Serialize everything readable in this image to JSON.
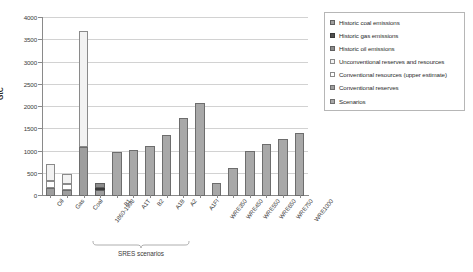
{
  "chart_data": {
    "type": "bar",
    "title": "",
    "subtitle": "",
    "xlabel": "",
    "ylabel": "GtC",
    "ylim": [
      0,
      4000
    ],
    "ytick_step": 500,
    "yticks": [
      "0",
      "500",
      "1000",
      "1500",
      "2000",
      "2500",
      "3000",
      "3500",
      "4000"
    ],
    "grid": "horizontal",
    "legend_position": "right",
    "categories": [
      "Oil",
      "Gas",
      "Coal",
      "1860-1998",
      "B1",
      "A1T",
      "B2",
      "A1B",
      "A2",
      "A1FI",
      "WRE350",
      "WRE450",
      "WRE550",
      "WRE650",
      "WRE750",
      "WRE1000"
    ],
    "series": [
      {
        "name": "Conventional reserves",
        "key": "conventional_reserves",
        "color": "#9e9e9e",
        "values": [
          170,
          140,
          1100,
          0,
          0,
          0,
          0,
          0,
          0,
          0,
          0,
          0,
          0,
          0,
          0,
          0
        ]
      },
      {
        "name": "Conventional resources (upper estimate)",
        "key": "conventional_resources_upper",
        "color": "#ffffff",
        "values": [
          160,
          125,
          0,
          0,
          0,
          0,
          0,
          0,
          0,
          0,
          0,
          0,
          0,
          0,
          0,
          0
        ]
      },
      {
        "name": "Unconventional reserves and resources",
        "key": "unconventional_reserves_resources",
        "color": "#f2f2f2",
        "values": [
          395,
          225,
          2600,
          0,
          0,
          0,
          0,
          0,
          0,
          0,
          0,
          0,
          0,
          0,
          0,
          0
        ]
      },
      {
        "name": "Historic oil emissions",
        "key": "historic_oil",
        "color": "#8c8c8c",
        "values": [
          0,
          0,
          0,
          100,
          0,
          0,
          0,
          0,
          0,
          0,
          0,
          0,
          0,
          0,
          0,
          0
        ]
      },
      {
        "name": "Historic gas emissions",
        "key": "historic_gas",
        "color": "#4f4f4f",
        "values": [
          0,
          0,
          0,
          50,
          0,
          0,
          0,
          0,
          0,
          0,
          0,
          0,
          0,
          0,
          0,
          0
        ]
      },
      {
        "name": "Historic coal emissions",
        "key": "historic_coal",
        "color": "#9e9e9e",
        "values": [
          0,
          0,
          0,
          140,
          0,
          0,
          0,
          0,
          0,
          0,
          0,
          0,
          0,
          0,
          0,
          0
        ]
      },
      {
        "name": "Scenarios",
        "key": "scenarios",
        "color": "#a8a8a8",
        "values": [
          0,
          0,
          0,
          0,
          985,
          1030,
          1120,
          1380,
          1750,
          2100,
          300,
          630,
          1010,
          1180,
          1280,
          1420
        ]
      }
    ],
    "totals": [
      725,
      490,
      3700,
      290,
      985,
      1030,
      1120,
      1380,
      1750,
      2100,
      300,
      630,
      1010,
      1180,
      1280,
      1420
    ],
    "annotations": [
      {
        "text": "SRES scenarios",
        "spans": [
          "B1",
          "A1FI"
        ]
      }
    ]
  },
  "axes": {
    "y_label": "GtC",
    "y_ticks": [
      "0",
      "500",
      "1000",
      "1500",
      "2000",
      "2500",
      "3000",
      "3500",
      "4000"
    ]
  },
  "x_labels": [
    "Oil",
    "Gas",
    "Coal",
    "1860-1998",
    "B1",
    "A1T",
    "B2",
    "A1B",
    "A2",
    "A1FI",
    "WRE350",
    "WRE450",
    "WRE550",
    "WRE650",
    "WRE750",
    "WRE1000"
  ],
  "bracket": {
    "label": "SRES scenarios"
  },
  "legend": {
    "items": [
      {
        "label": "Historic coal emissions",
        "swatch": "sw-coal"
      },
      {
        "label": "Historic gas emissions",
        "swatch": "sw-gas"
      },
      {
        "label": "Historic oil emissions",
        "swatch": "sw-oil"
      },
      {
        "label": "Unconventional reserves and resources",
        "swatch": "sw-unconv"
      },
      {
        "label": "Conventional resources (upper estimate)",
        "swatch": "sw-convup"
      },
      {
        "label": "Conventional reserves",
        "swatch": "sw-convres"
      },
      {
        "label": "Scenarios",
        "swatch": "sw-scen"
      }
    ]
  },
  "colors": {
    "grid": "#d2d2d2",
    "axis": "#8a8a8a",
    "scenario_bar": "#a8a8a8",
    "reserves_bar": "#9e9e9e",
    "gas_dark": "#4f4f4f"
  }
}
